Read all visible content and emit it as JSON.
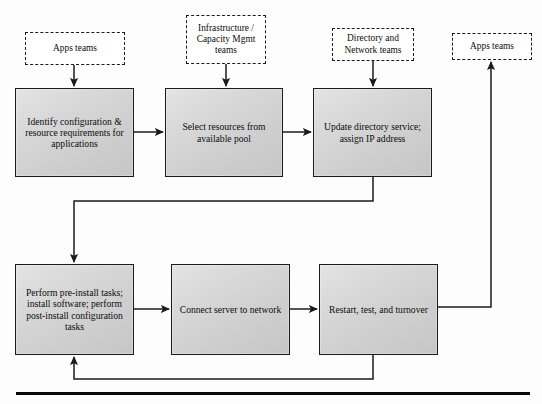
{
  "diagram": {
    "type": "flowchart",
    "colors": {
      "process_fill_light": "#e4e4e4",
      "process_fill_dark": "#c6c6c6",
      "stroke": "#1b1b1b",
      "actor_fill": "#ffffff",
      "rule": "#0a0a0a"
    },
    "actors": [
      {
        "id": "actor-apps-teams-left",
        "label": "Apps teams",
        "x": 25,
        "y": 32,
        "w": 100,
        "h": 33
      },
      {
        "id": "actor-infrastructure-capacity",
        "label": "Infrastructure / Capacity Mgmt teams",
        "x": 186,
        "y": 15,
        "w": 80,
        "h": 49
      },
      {
        "id": "actor-directory-network",
        "label": "Directory and Network teams",
        "x": 332,
        "y": 28,
        "w": 82,
        "h": 33
      },
      {
        "id": "actor-apps-teams-right",
        "label": "Apps teams",
        "x": 452,
        "y": 33,
        "w": 80,
        "h": 27
      }
    ],
    "processes": [
      {
        "id": "process-identify-configuration",
        "label": "Identify configuration & resource requirements for applications",
        "x": 15,
        "y": 88,
        "w": 119,
        "h": 89
      },
      {
        "id": "process-select-resources",
        "label": "Select resources from available pool",
        "x": 165,
        "y": 88,
        "w": 118,
        "h": 89
      },
      {
        "id": "process-update-directory",
        "label": "Update directory service; assign IP address",
        "x": 313,
        "y": 88,
        "w": 119,
        "h": 89
      },
      {
        "id": "process-perform-install-tasks",
        "label": "Perform pre-install tasks; install software; perform post-install configuration tasks",
        "x": 15,
        "y": 264,
        "w": 119,
        "h": 91
      },
      {
        "id": "process-connect-server",
        "label": "Connect server to network",
        "x": 171,
        "y": 264,
        "w": 119,
        "h": 91
      },
      {
        "id": "process-restart-test-turnover",
        "label": "Restart, test, and turnover",
        "x": 319,
        "y": 264,
        "w": 119,
        "h": 91
      }
    ],
    "connectors": [
      {
        "id": "connector-apps-to-identify",
        "from": "actor-apps-teams-left",
        "to": "process-identify-configuration",
        "arrow": "down"
      },
      {
        "id": "connector-infrastructure-to-select",
        "from": "actor-infrastructure-capacity",
        "to": "process-select-resources",
        "arrow": "down"
      },
      {
        "id": "connector-directory-to-update",
        "from": "actor-directory-network",
        "to": "process-update-directory",
        "arrow": "down"
      },
      {
        "id": "connector-identify-to-select",
        "from": "process-identify-configuration",
        "to": "process-select-resources",
        "arrow": "right"
      },
      {
        "id": "connector-select-to-update",
        "from": "process-select-resources",
        "to": "process-update-directory",
        "arrow": "right"
      },
      {
        "id": "connector-update-to-perform",
        "from": "process-update-directory",
        "to": "process-perform-install-tasks",
        "arrow": "down"
      },
      {
        "id": "connector-perform-to-connect",
        "from": "process-perform-install-tasks",
        "to": "process-connect-server",
        "arrow": "right"
      },
      {
        "id": "connector-connect-to-restart",
        "from": "process-connect-server",
        "to": "process-restart-test-turnover",
        "arrow": "right"
      },
      {
        "id": "connector-restart-to-apps-right",
        "from": "process-restart-test-turnover",
        "to": "actor-apps-teams-right",
        "arrow": "up"
      },
      {
        "id": "connector-restart-feedback-to-perform",
        "from": "process-restart-test-turnover",
        "to": "process-perform-install-tasks",
        "arrow": "up"
      }
    ],
    "footer_rule": {
      "id": "footer-rule",
      "x": 16,
      "y": 392,
      "w": 514,
      "h": 3
    }
  }
}
